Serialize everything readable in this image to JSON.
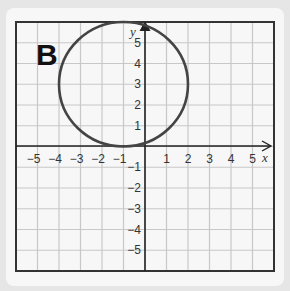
{
  "panel_label": "B",
  "chart_data": {
    "type": "scatter",
    "title": "",
    "xlabel": "x",
    "ylabel": "y",
    "xlim": [
      -6,
      6
    ],
    "ylim": [
      -6,
      6
    ],
    "grid": true,
    "x_ticks": [
      "-5",
      "-4",
      "-3",
      "-2",
      "-1",
      "1",
      "2",
      "3",
      "4",
      "5"
    ],
    "y_ticks": [
      "5",
      "4",
      "3",
      "2",
      "1",
      "-1",
      "-2",
      "-3",
      "-4",
      "-5"
    ],
    "shapes": [
      {
        "shape": "circle",
        "center": [
          -1,
          3
        ],
        "radius": 3
      }
    ]
  }
}
